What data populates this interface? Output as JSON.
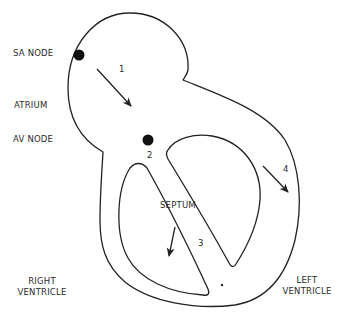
{
  "diagram": {
    "labels": {
      "sa_node": "SA NODE",
      "atrium": "ATRIUM",
      "av_node": "AV NODE",
      "septum": "SEPTUM",
      "right_ventricle_line1": "RIGHT",
      "right_ventricle_line2": "VENTRICLE",
      "left_ventricle_line1": "LEFT",
      "left_ventricle_line2": "VENTRICLE"
    },
    "steps": [
      {
        "number": "1",
        "description": "SA node to AV node through atrium"
      },
      {
        "number": "2",
        "description": "AV node"
      },
      {
        "number": "3",
        "description": "Down the septum"
      },
      {
        "number": "4",
        "description": "Through left ventricle wall"
      }
    ],
    "colors": {
      "stroke": "#222222",
      "node": "#111111",
      "background": "#ffffff"
    }
  }
}
